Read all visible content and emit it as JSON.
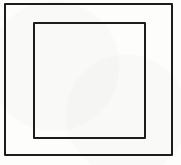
{
  "figure": {
    "kind": "nested-squares-line-drawing",
    "background_color": "#fdfdfc",
    "stroke_color": "#1c1c1c",
    "outer_square": {
      "left": 4,
      "top": 3,
      "width": 169,
      "height": 153,
      "border_width": 2,
      "border_color": "#1c1c1c"
    },
    "inner_square": {
      "left": 33,
      "top": 22,
      "width": 113,
      "height": 117,
      "border_width": 2,
      "border_color": "#1c1c1c"
    }
  }
}
